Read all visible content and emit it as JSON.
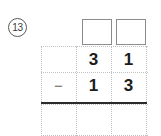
{
  "worksheet": {
    "problem_number": "13",
    "type": "vertical-subtraction",
    "operator": "−",
    "answer_boxes": [
      {
        "name": "tens-answer-box",
        "value": ""
      },
      {
        "name": "ones-answer-box",
        "value": ""
      }
    ],
    "grid": {
      "columns": 3,
      "rows": 3,
      "line_style": "dotted",
      "line_color": "#c2c2c2",
      "rule_color": "#2b2b2b"
    },
    "rows": {
      "minuend": {
        "operator": "",
        "tens": "3",
        "ones": "1"
      },
      "subtrahend": {
        "operator": "−",
        "tens": "1",
        "ones": "3"
      },
      "answer": {
        "operator": "",
        "tens": "",
        "ones": ""
      }
    }
  }
}
